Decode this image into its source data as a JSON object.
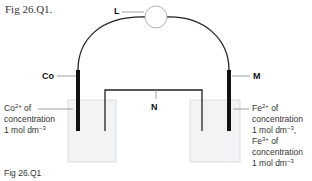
{
  "figure": {
    "title": "Fig 26.Q1.",
    "caption": "Fig 26.Q1"
  },
  "labels": {
    "L": "L",
    "Co": "Co",
    "M": "M",
    "N": "N"
  },
  "left_solution": {
    "ion": "Co",
    "charge": "2+",
    "line1_suffix": " of",
    "line2": "concentration",
    "line3": "1 mol dm",
    "line3_exp": "−3"
  },
  "right_solution": {
    "ion1": "Fe",
    "charge1": "2+",
    "line1_suffix": " of",
    "line2": "concentration",
    "line3": "1 mol dm",
    "line3_exp": "−3",
    "line3_suffix": ",",
    "ion2": "Fe",
    "charge2": "3+",
    "line4_suffix": " of",
    "line5": "concentration",
    "line6": "1 mol dm",
    "line6_exp": "−3"
  },
  "colors": {
    "wire": "#222222",
    "electrode": "#111111",
    "beaker_fill": "#f2f3f5",
    "beaker_edge": "#dcdde0",
    "meter_edge": "#b0b0b0",
    "leader_line": "#888888"
  }
}
